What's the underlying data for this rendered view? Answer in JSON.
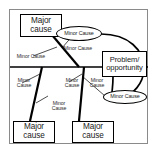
{
  "diagram": {
    "type": "fishbone",
    "frame": {
      "stroke": "#8a8a8a"
    },
    "colors": {
      "line": "#000000",
      "text": "#1a1a1a",
      "background": "#ffffff",
      "frame": "#8a8a8a"
    },
    "effect": {
      "label": "Problem/\nopportunity"
    },
    "major_causes": [
      {
        "id": "major-top-left",
        "label": "Major\ncause"
      },
      {
        "id": "major-bottom-left",
        "label": "Major\ncause"
      },
      {
        "id": "major-bottom-center",
        "label": "Major\ncause"
      }
    ],
    "minor_causes_ellipses": [
      {
        "id": "minor-ellipse-top",
        "label": "Minor Cause"
      },
      {
        "id": "minor-ellipse-bottom",
        "label": "Minor Cause"
      }
    ],
    "minor_causes_labels": [
      {
        "id": "minor-label-upper-left",
        "label": "Minor Cause"
      },
      {
        "id": "minor-label-upper-center",
        "label": "Minor Cause"
      },
      {
        "id": "minor-label-left-upper",
        "label": "Minor\nCause"
      },
      {
        "id": "minor-label-left-lower",
        "label": "Minor\nCause"
      },
      {
        "id": "minor-label-center-upper",
        "label": "Minor\nCause"
      },
      {
        "id": "minor-label-center-lower",
        "label": "Minor\nCause"
      }
    ]
  }
}
